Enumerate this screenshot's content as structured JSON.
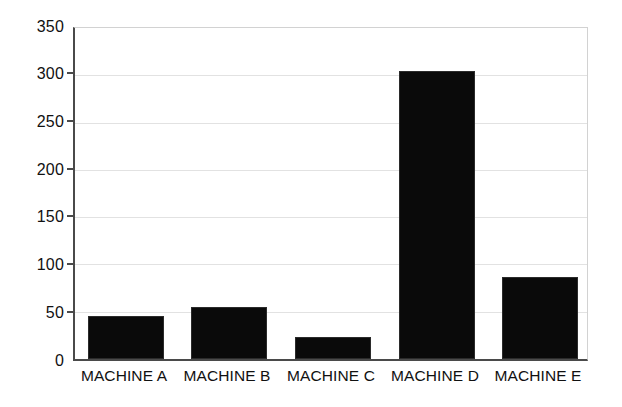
{
  "chart_data": {
    "type": "bar",
    "title": "",
    "subtitle": "",
    "xlabel": "",
    "ylabel": "",
    "categories": [
      "MACHINE A",
      "MACHINE B",
      "MACHINE C",
      "MACHINE D",
      "MACHINE E"
    ],
    "values": [
      46,
      55,
      23,
      305,
      87
    ],
    "ylim": [
      0,
      350
    ],
    "ytick_labels": [
      "0",
      "50",
      "100",
      "150",
      "200",
      "250",
      "300",
      "350"
    ],
    "ytick_values": [
      0,
      50,
      100,
      150,
      200,
      250,
      300,
      350
    ],
    "grid": true,
    "grid_axis": "y",
    "legend": false,
    "legend_position": "none",
    "bar_color": "#0a0a0a",
    "axis_color": "#4a4a4a",
    "grid_color": "#e2e2e2",
    "background_color": "#ffffff"
  }
}
